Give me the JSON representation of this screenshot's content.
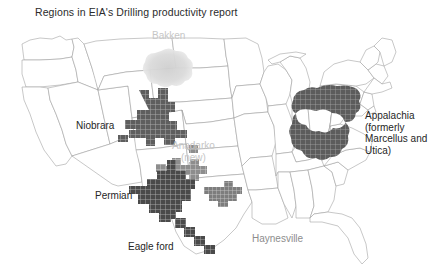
{
  "figure": {
    "title": "Regions in EIA's Drilling productivity report",
    "background_color": "#ffffff",
    "state_border_color": "#9a9a9a"
  },
  "map": {
    "projection_note": "contiguous united states outline",
    "labels": [
      {
        "id": "bakken",
        "text": "Bakken",
        "tone": "light",
        "x": 152,
        "y": 16
      },
      {
        "id": "niobrara",
        "text": "Niobrara",
        "tone": "dark",
        "x": 76,
        "y": 106
      },
      {
        "id": "anadarko",
        "text": "Anadarko\n(new)",
        "tone": "light",
        "x": 172,
        "y": 126
      },
      {
        "id": "appalachia",
        "text": "Appalachia\n(formerly\nMarcellus and\nUtica)",
        "tone": "dark",
        "x": 365,
        "y": 96
      },
      {
        "id": "permian",
        "text": "Permian",
        "tone": "dark",
        "x": 95,
        "y": 176
      },
      {
        "id": "eagleford",
        "text": "Eagle ford",
        "tone": "dark",
        "x": 128,
        "y": 227
      },
      {
        "id": "haynesville",
        "text": "Haynesville",
        "tone": "mid",
        "x": 252,
        "y": 219
      }
    ],
    "regions": [
      {
        "id": "bakken",
        "name": "Bakken",
        "shade": "#d8d8d8",
        "opacity": 0.85
      },
      {
        "id": "niobrara",
        "name": "Niobrara",
        "shade": "#595959",
        "opacity": 1
      },
      {
        "id": "anadarko",
        "name": "Anadarko",
        "shade": "#8a8a8a",
        "opacity": 1
      },
      {
        "id": "permian",
        "name": "Permian",
        "shade": "#4a4a4a",
        "opacity": 1
      },
      {
        "id": "eagleford",
        "name": "Eagle ford",
        "shade": "#4a4a4a",
        "opacity": 1
      },
      {
        "id": "haynesville",
        "name": "Haynesville",
        "shade": "#7d7d7d",
        "opacity": 1
      },
      {
        "id": "appalachia",
        "name": "Appalachia",
        "shade": "#5c5c5c",
        "opacity": 1
      }
    ]
  }
}
